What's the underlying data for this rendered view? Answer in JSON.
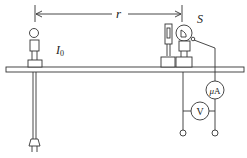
{
  "diagram": {
    "type": "photoelectric-experiment-apparatus",
    "labels": {
      "distance": "r",
      "source_intensity": "I",
      "source_intensity_subscript": "0",
      "photocell": "S",
      "microammeter_mu": "μ",
      "microammeter_unit": "A",
      "voltmeter": "V"
    },
    "components": [
      {
        "id": "lamp",
        "name": "light bulb on stand"
      },
      {
        "id": "slit",
        "name": "slit/filter holder"
      },
      {
        "id": "photocell",
        "name": "photocell S"
      },
      {
        "id": "microammeter",
        "name": "microammeter μA"
      },
      {
        "id": "voltmeter",
        "name": "voltmeter V"
      },
      {
        "id": "bench",
        "name": "optical bench"
      },
      {
        "id": "plug",
        "name": "power plug"
      },
      {
        "id": "terminals",
        "name": "two output terminals"
      }
    ],
    "colors": {
      "stroke": "#333333",
      "background": "#ffffff"
    }
  }
}
